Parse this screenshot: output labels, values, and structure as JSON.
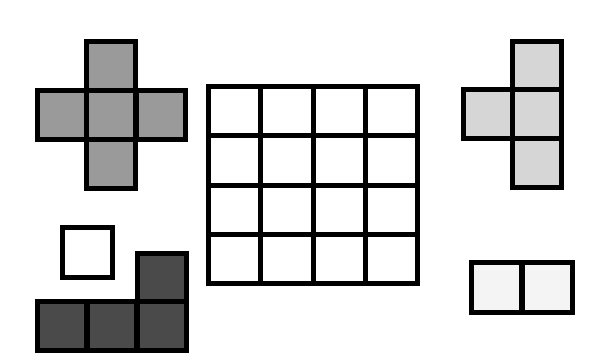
{
  "diagram": {
    "border_color": "#000000",
    "grid": {
      "rows": 4,
      "cols": 4,
      "x": 206,
      "y": 84,
      "width": 214,
      "height": 202,
      "fill": "#ffffff"
    },
    "pieces": [
      {
        "name": "plus-pentomino",
        "fill": "#9a9a9a",
        "cell_size": 54,
        "cells": [
          [
            84,
            39
          ],
          [
            35,
            88
          ],
          [
            84,
            88
          ],
          [
            134,
            88
          ],
          [
            84,
            137
          ]
        ]
      },
      {
        "name": "t-tetromino",
        "fill": "#d6d6d6",
        "cell_size": 54,
        "cells": [
          [
            510,
            39
          ],
          [
            461,
            87
          ],
          [
            510,
            87
          ],
          [
            510,
            136
          ]
        ]
      },
      {
        "name": "monomino",
        "fill": "#ffffff",
        "cell_size": 55,
        "cells": [
          [
            60,
            225
          ]
        ]
      },
      {
        "name": "l-tetromino",
        "fill": "#4a4a4a",
        "cell_size": 54,
        "cells": [
          [
            135,
            251
          ],
          [
            35,
            299
          ],
          [
            85,
            299
          ],
          [
            135,
            299
          ]
        ]
      },
      {
        "name": "domino",
        "fill": "#f4f4f4",
        "cell_size": 55,
        "cells": [
          [
            469,
            260
          ],
          [
            520,
            260
          ]
        ]
      }
    ]
  }
}
